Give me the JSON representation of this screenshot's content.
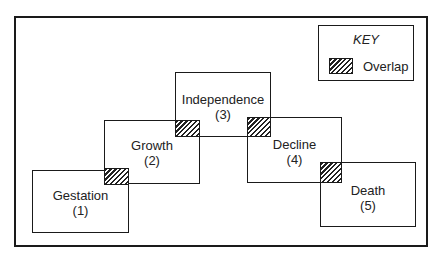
{
  "key": {
    "title": "KEY",
    "items": [
      {
        "swatch": "hatched",
        "label": "Overlap"
      }
    ]
  },
  "stages": [
    {
      "name": "Gestation",
      "number": "(1)"
    },
    {
      "name": "Growth",
      "number": "(2)"
    },
    {
      "name": "Independence",
      "number": "(3)"
    },
    {
      "name": "Decline",
      "number": "(4)"
    },
    {
      "name": "Death",
      "number": "(5)"
    }
  ],
  "overlaps": [
    {
      "between": [
        "Gestation",
        "Growth"
      ]
    },
    {
      "between": [
        "Growth",
        "Independence"
      ]
    },
    {
      "between": [
        "Independence",
        "Decline"
      ]
    },
    {
      "between": [
        "Decline",
        "Death"
      ]
    }
  ],
  "colors": {
    "line": "#1a1a1a",
    "background": "#ffffff"
  }
}
